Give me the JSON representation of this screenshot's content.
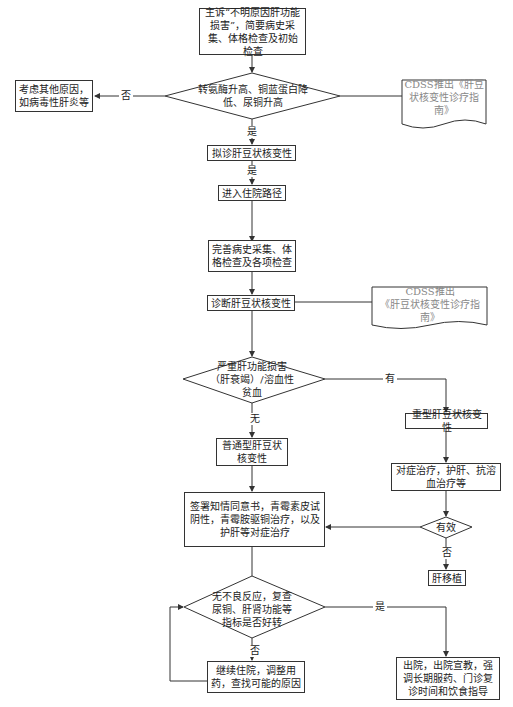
{
  "flowchart": {
    "start": "主诉“不明原因肝功能损害”，简要病史采集、体格检查及初始检查",
    "decision1": "转氨酶升高、铜蓝蛋白降低、尿铜升高",
    "decision1_no_label": "否",
    "decision1_yes_label": "是",
    "other_causes": "考虑其他原因，如病毒性肝炎等",
    "cdss1": "CDSS推出《肝豆状核变性诊疗指南》",
    "suspected": "拟诊肝豆状核变性",
    "suspected_yes_label": "是",
    "admission": "进入住院路径",
    "complete_exam": "完善病史采集、体格检查及各项检查",
    "diagnosis": "诊断肝豆状核变性",
    "cdss2_line1": "CDSS推出",
    "cdss2_line2": "《肝豆状核变性诊疗指南》",
    "decision2": "严重肝功能损害（肝衰竭）/溶血性贫血",
    "decision2_yes_label": "有",
    "decision2_no_label": "无",
    "severe_type": "重型肝豆状核变性",
    "symptomatic": "对症治疗，护肝、抗溶血治疗等",
    "effective": "有效",
    "effective_no_label": "否",
    "transplant": "肝移植",
    "normal_type": "普通型肝豆状核变性",
    "treatment": "签署知情同意书，青霉素皮试阴性，青霉胺驱铜治疗，以及护肝等对症治疗",
    "decision3": "无不良反应，复查尿铜、肝肾功能等指标是否好转",
    "decision3_yes_label": "是",
    "decision3_no_label": "否",
    "continue": "继续住院，调整用药，查找可能的原因",
    "discharge": "出院，出院宣教，强调长期服药、门诊复诊时间和饮食指导"
  }
}
